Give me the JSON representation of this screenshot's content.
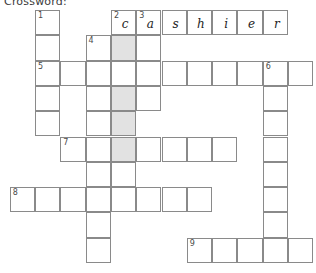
{
  "title": "Crossword:",
  "grid": {
    "origin_x": 35,
    "origin_y": 10,
    "cell_size": 25.3,
    "columns": 10,
    "rows": 10,
    "shade_color": "#e2e2e2",
    "line_color": "#8a8a8a"
  },
  "answers": {
    "two_across": "cashier"
  },
  "cells": [
    {
      "r": 0,
      "c": 0,
      "num": "1",
      "letter": "",
      "shaded": false
    },
    {
      "r": 0,
      "c": 3,
      "num": "2",
      "letter": "c",
      "shaded": false
    },
    {
      "r": 0,
      "c": 4,
      "num": "3",
      "letter": "a",
      "shaded": false
    },
    {
      "r": 0,
      "c": 5,
      "num": "",
      "letter": "s",
      "shaded": false
    },
    {
      "r": 0,
      "c": 6,
      "num": "",
      "letter": "h",
      "shaded": false
    },
    {
      "r": 0,
      "c": 7,
      "num": "",
      "letter": "i",
      "shaded": false
    },
    {
      "r": 0,
      "c": 8,
      "num": "",
      "letter": "e",
      "shaded": false
    },
    {
      "r": 0,
      "c": 9,
      "num": "",
      "letter": "r",
      "shaded": false
    },
    {
      "r": 1,
      "c": 0,
      "num": "",
      "letter": "",
      "shaded": false
    },
    {
      "r": 1,
      "c": 2,
      "num": "4",
      "letter": "",
      "shaded": false
    },
    {
      "r": 1,
      "c": 3,
      "num": "",
      "letter": "",
      "shaded": true
    },
    {
      "r": 1,
      "c": 4,
      "num": "",
      "letter": "",
      "shaded": false
    },
    {
      "r": 2,
      "c": 0,
      "num": "5",
      "letter": "",
      "shaded": false
    },
    {
      "r": 2,
      "c": 1,
      "num": "",
      "letter": "",
      "shaded": false
    },
    {
      "r": 2,
      "c": 2,
      "num": "",
      "letter": "",
      "shaded": false
    },
    {
      "r": 2,
      "c": 3,
      "num": "",
      "letter": "",
      "shaded": false
    },
    {
      "r": 2,
      "c": 4,
      "num": "",
      "letter": "",
      "shaded": false
    },
    {
      "r": 2,
      "c": 5,
      "num": "",
      "letter": "",
      "shaded": false
    },
    {
      "r": 2,
      "c": 6,
      "num": "",
      "letter": "",
      "shaded": false
    },
    {
      "r": 2,
      "c": 7,
      "num": "",
      "letter": "",
      "shaded": false
    },
    {
      "r": 2,
      "c": 8,
      "num": "",
      "letter": "",
      "shaded": false
    },
    {
      "r": 2,
      "c": 9,
      "num": "6",
      "letter": "",
      "shaded": false
    },
    {
      "r": 2,
      "c": 10,
      "num": "",
      "letter": "",
      "shaded": false
    },
    {
      "r": 3,
      "c": 0,
      "num": "",
      "letter": "",
      "shaded": false
    },
    {
      "r": 3,
      "c": 2,
      "num": "",
      "letter": "",
      "shaded": false
    },
    {
      "r": 3,
      "c": 3,
      "num": "",
      "letter": "",
      "shaded": true
    },
    {
      "r": 3,
      "c": 4,
      "num": "",
      "letter": "",
      "shaded": false
    },
    {
      "r": 3,
      "c": 9,
      "num": "",
      "letter": "",
      "shaded": false
    },
    {
      "r": 4,
      "c": 0,
      "num": "",
      "letter": "",
      "shaded": false
    },
    {
      "r": 4,
      "c": 2,
      "num": "",
      "letter": "",
      "shaded": false
    },
    {
      "r": 4,
      "c": 3,
      "num": "",
      "letter": "",
      "shaded": true
    },
    {
      "r": 4,
      "c": 9,
      "num": "",
      "letter": "",
      "shaded": false
    },
    {
      "r": 5,
      "c": 1,
      "num": "7",
      "letter": "",
      "shaded": false
    },
    {
      "r": 5,
      "c": 2,
      "num": "",
      "letter": "",
      "shaded": false
    },
    {
      "r": 5,
      "c": 3,
      "num": "",
      "letter": "",
      "shaded": true
    },
    {
      "r": 5,
      "c": 4,
      "num": "",
      "letter": "",
      "shaded": false
    },
    {
      "r": 5,
      "c": 5,
      "num": "",
      "letter": "",
      "shaded": false
    },
    {
      "r": 5,
      "c": 6,
      "num": "",
      "letter": "",
      "shaded": false
    },
    {
      "r": 5,
      "c": 7,
      "num": "",
      "letter": "",
      "shaded": false
    },
    {
      "r": 5,
      "c": 9,
      "num": "",
      "letter": "",
      "shaded": false
    },
    {
      "r": 6,
      "c": 2,
      "num": "",
      "letter": "",
      "shaded": false
    },
    {
      "r": 6,
      "c": 3,
      "num": "",
      "letter": "",
      "shaded": false
    },
    {
      "r": 6,
      "c": 9,
      "num": "",
      "letter": "",
      "shaded": false
    },
    {
      "r": 7,
      "c": -1,
      "num": "8",
      "letter": "",
      "shaded": false
    },
    {
      "r": 7,
      "c": 0,
      "num": "",
      "letter": "",
      "shaded": false
    },
    {
      "r": 7,
      "c": 1,
      "num": "",
      "letter": "",
      "shaded": false
    },
    {
      "r": 7,
      "c": 2,
      "num": "",
      "letter": "",
      "shaded": false
    },
    {
      "r": 7,
      "c": 3,
      "num": "",
      "letter": "",
      "shaded": false
    },
    {
      "r": 7,
      "c": 4,
      "num": "",
      "letter": "",
      "shaded": false
    },
    {
      "r": 7,
      "c": 5,
      "num": "",
      "letter": "",
      "shaded": false
    },
    {
      "r": 7,
      "c": 6,
      "num": "",
      "letter": "",
      "shaded": false
    },
    {
      "r": 7,
      "c": 9,
      "num": "",
      "letter": "",
      "shaded": false
    },
    {
      "r": 8,
      "c": 2,
      "num": "",
      "letter": "",
      "shaded": false
    },
    {
      "r": 8,
      "c": 9,
      "num": "",
      "letter": "",
      "shaded": false
    },
    {
      "r": 9,
      "c": 2,
      "num": "",
      "letter": "",
      "shaded": false
    },
    {
      "r": 9,
      "c": 6,
      "num": "9",
      "letter": "",
      "shaded": false
    },
    {
      "r": 9,
      "c": 7,
      "num": "",
      "letter": "",
      "shaded": false
    },
    {
      "r": 9,
      "c": 8,
      "num": "",
      "letter": "",
      "shaded": false
    },
    {
      "r": 9,
      "c": 9,
      "num": "",
      "letter": "",
      "shaded": false
    },
    {
      "r": 9,
      "c": 10,
      "num": "",
      "letter": "",
      "shaded": false
    }
  ]
}
